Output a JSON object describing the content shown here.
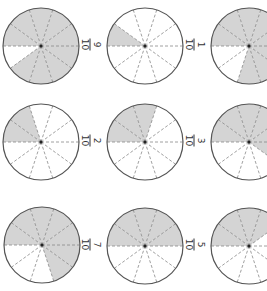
{
  "worksheet": {
    "orientation": "rotated 90 degrees clockwise",
    "colors": {
      "shade": "#d4d4d4",
      "outline": "#555555",
      "divider": "#888888",
      "background": "#ffffff"
    },
    "circles": [
      {
        "row": 0,
        "col": 0,
        "cx": 41,
        "cy": 46,
        "shaded": 9,
        "parts": 10
      },
      {
        "row": 0,
        "col": 1,
        "cx": 145,
        "cy": 46,
        "shaded": 1,
        "parts": 10
      },
      {
        "row": 0,
        "col": 2,
        "cx": 249,
        "cy": 46,
        "shaded": 8,
        "parts": 10
      },
      {
        "row": 1,
        "col": 0,
        "cx": 41,
        "cy": 142,
        "shaded": 2,
        "parts": 10
      },
      {
        "row": 1,
        "col": 1,
        "cx": 145,
        "cy": 142,
        "shaded": 3,
        "parts": 10
      },
      {
        "row": 1,
        "col": 2,
        "cx": 249,
        "cy": 142,
        "shaded": 6,
        "parts": 10
      },
      {
        "row": 2,
        "col": 0,
        "cx": 42,
        "cy": 245,
        "shaded": 7,
        "parts": 10
      },
      {
        "row": 2,
        "col": 1,
        "cx": 145,
        "cy": 246,
        "shaded": 5,
        "parts": 10
      },
      {
        "row": 2,
        "col": 2,
        "cx": 249,
        "cy": 246,
        "shaded": 4,
        "parts": 10
      }
    ],
    "labels": [
      {
        "x": 90,
        "y": 46,
        "numerator": "9",
        "denominator": "10"
      },
      {
        "x": 194,
        "y": 46,
        "numerator": "1",
        "denominator": "10"
      },
      {
        "x": 90,
        "y": 142,
        "numerator": "2",
        "denominator": "10"
      },
      {
        "x": 194,
        "y": 142,
        "numerator": "3",
        "denominator": "10"
      },
      {
        "x": 90,
        "y": 246,
        "numerator": "7",
        "denominator": "10"
      },
      {
        "x": 194,
        "y": 246,
        "numerator": "5",
        "denominator": "10"
      }
    ]
  }
}
